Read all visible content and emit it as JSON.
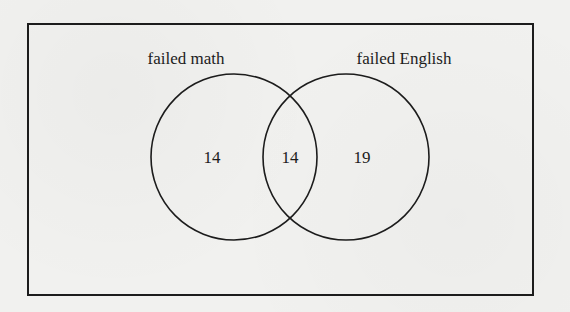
{
  "diagram": {
    "type": "venn",
    "universe_box": true,
    "sets": [
      {
        "label": "failed math",
        "only_count": "14"
      },
      {
        "label": "failed English",
        "only_count": "19"
      }
    ],
    "intersection_count": "14",
    "colors": {
      "stroke": "#1c1c1c",
      "background": "#f1f1ef"
    }
  }
}
